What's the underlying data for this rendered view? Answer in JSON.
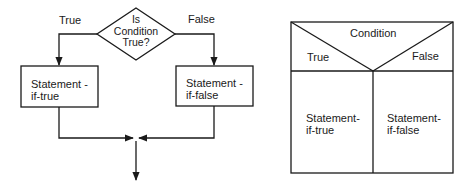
{
  "flowchart": {
    "decision": {
      "line1": "Is",
      "line2": "Condition",
      "line3": "True?"
    },
    "branch_true_label": "True",
    "branch_false_label": "False",
    "true_box": {
      "line1": "Statement -",
      "line2": "if-true"
    },
    "false_box": {
      "line1": "Statement -",
      "line2": "if-false"
    }
  },
  "nassi_shneiderman": {
    "condition_label": "Condition",
    "true_label": "True",
    "false_label": "False",
    "true_cell": {
      "line1": "Statement-",
      "line2": "if-true"
    },
    "false_cell": {
      "line1": "Statement-",
      "line2": "if-false"
    }
  },
  "colors": {
    "stroke": "#1a1a1a",
    "background": "#ffffff"
  }
}
